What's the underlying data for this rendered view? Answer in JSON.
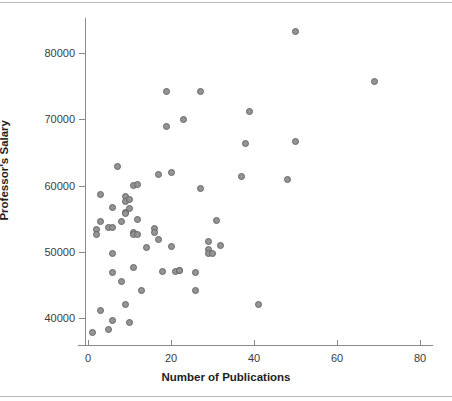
{
  "chart_data": {
    "type": "scatter",
    "title": "",
    "xlabel": "Number of Publications",
    "ylabel": "Professor's Salary",
    "xlim": [
      -2,
      84
    ],
    "ylim": [
      36500,
      84500
    ],
    "xticks": [
      0,
      20,
      40,
      60,
      80
    ],
    "xtick_labels": [
      "0",
      "20",
      "40",
      "60",
      "80"
    ],
    "yticks": [
      40000,
      50000,
      60000,
      70000,
      80000
    ],
    "ytick_labels": [
      "40000",
      "50000",
      "60000",
      "70000",
      "80000"
    ],
    "grid": false,
    "legend": null,
    "marker": {
      "shape": "circle",
      "fill_color": "#949494",
      "edge_color": "#666666",
      "size_px": 7
    },
    "axis_color": "#8a8a8a",
    "background": "#ffffff",
    "points": [
      {
        "x": 1,
        "y": 37800
      },
      {
        "x": 3,
        "y": 41200
      },
      {
        "x": 3,
        "y": 54600
      },
      {
        "x": 3,
        "y": 58600
      },
      {
        "x": 2,
        "y": 53300
      },
      {
        "x": 2,
        "y": 52600
      },
      {
        "x": 5,
        "y": 38200
      },
      {
        "x": 6,
        "y": 39600
      },
      {
        "x": 5,
        "y": 53600
      },
      {
        "x": 6,
        "y": 53700
      },
      {
        "x": 6,
        "y": 49700
      },
      {
        "x": 6,
        "y": 46900
      },
      {
        "x": 6,
        "y": 56700
      },
      {
        "x": 7,
        "y": 62800
      },
      {
        "x": 8,
        "y": 45500
      },
      {
        "x": 9,
        "y": 42000
      },
      {
        "x": 10,
        "y": 39300
      },
      {
        "x": 8,
        "y": 54600
      },
      {
        "x": 9,
        "y": 58400
      },
      {
        "x": 9,
        "y": 57600
      },
      {
        "x": 9,
        "y": 55900
      },
      {
        "x": 9,
        "y": 55700
      },
      {
        "x": 10,
        "y": 57900
      },
      {
        "x": 10,
        "y": 56600
      },
      {
        "x": 11,
        "y": 47600
      },
      {
        "x": 11,
        "y": 52900
      },
      {
        "x": 11,
        "y": 52600
      },
      {
        "x": 11,
        "y": 60000
      },
      {
        "x": 12,
        "y": 60200
      },
      {
        "x": 12,
        "y": 54800
      },
      {
        "x": 12,
        "y": 52600
      },
      {
        "x": 13,
        "y": 44100
      },
      {
        "x": 14,
        "y": 50700
      },
      {
        "x": 16,
        "y": 53500
      },
      {
        "x": 16,
        "y": 52900
      },
      {
        "x": 17,
        "y": 61700
      },
      {
        "x": 17,
        "y": 51900
      },
      {
        "x": 18,
        "y": 47000
      },
      {
        "x": 19,
        "y": 74200
      },
      {
        "x": 19,
        "y": 68900
      },
      {
        "x": 20,
        "y": 62000
      },
      {
        "x": 20,
        "y": 50800
      },
      {
        "x": 21,
        "y": 47000
      },
      {
        "x": 22,
        "y": 47200
      },
      {
        "x": 22,
        "y": 47200
      },
      {
        "x": 23,
        "y": 69900
      },
      {
        "x": 26,
        "y": 46900
      },
      {
        "x": 26,
        "y": 44200
      },
      {
        "x": 27,
        "y": 74200
      },
      {
        "x": 27,
        "y": 59600
      },
      {
        "x": 29,
        "y": 51500
      },
      {
        "x": 29,
        "y": 50300
      },
      {
        "x": 29,
        "y": 49700
      },
      {
        "x": 30,
        "y": 49700
      },
      {
        "x": 31,
        "y": 54700
      },
      {
        "x": 32,
        "y": 51000
      },
      {
        "x": 37,
        "y": 61300
      },
      {
        "x": 38,
        "y": 66400
      },
      {
        "x": 39,
        "y": 71100
      },
      {
        "x": 41,
        "y": 42000
      },
      {
        "x": 48,
        "y": 60900
      },
      {
        "x": 50,
        "y": 66700
      },
      {
        "x": 50,
        "y": 83300
      },
      {
        "x": 69,
        "y": 75700
      }
    ]
  },
  "axes": {
    "y_title": "Professor's Salary",
    "x_title": "Number of Publications"
  }
}
